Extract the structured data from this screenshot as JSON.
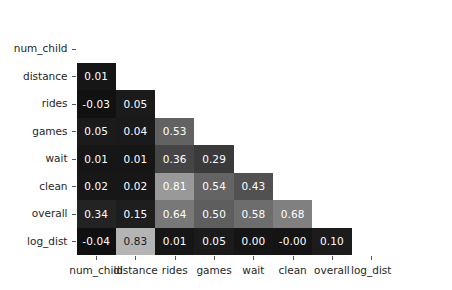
{
  "chart_data": {
    "type": "heatmap",
    "title": "",
    "xlabel": "",
    "ylabel": "",
    "grid": false,
    "legend": "none",
    "colormap": "gray",
    "annotated": true,
    "mask": "lower-triangle",
    "x_tick_labels": [
      "num_child",
      "distance",
      "rides",
      "games",
      "wait",
      "clean",
      "overall",
      "log_dist"
    ],
    "y_tick_labels": [
      "num_child",
      "distance",
      "rides",
      "games",
      "wait",
      "clean",
      "overall",
      "log_dist"
    ],
    "categories": [
      "num_child",
      "distance",
      "rides",
      "games",
      "wait",
      "clean",
      "overall",
      "log_dist"
    ],
    "zlim": [
      -0.04,
      0.83
    ],
    "rows": [
      {
        "label": "num_child",
        "cells": []
      },
      {
        "label": "distance",
        "cells": [
          {
            "col": "num_child",
            "value": "0.01",
            "v": 0.01,
            "shade": "#161616"
          }
        ]
      },
      {
        "label": "rides",
        "cells": [
          {
            "col": "num_child",
            "value": "-0.03",
            "v": -0.03,
            "shade": "#111111"
          },
          {
            "col": "distance",
            "value": "0.05",
            "v": 0.05,
            "shade": "#1b1b1b"
          }
        ]
      },
      {
        "label": "games",
        "cells": [
          {
            "col": "num_child",
            "value": "0.05",
            "v": 0.05,
            "shade": "#1b1b1b"
          },
          {
            "col": "distance",
            "value": "0.04",
            "v": 0.04,
            "shade": "#1a1a1a"
          },
          {
            "col": "rides",
            "value": "0.53",
            "v": 0.53,
            "shade": "#626262"
          }
        ]
      },
      {
        "label": "wait",
        "cells": [
          {
            "col": "num_child",
            "value": "0.01",
            "v": 0.01,
            "shade": "#161616"
          },
          {
            "col": "distance",
            "value": "0.01",
            "v": 0.01,
            "shade": "#161616"
          },
          {
            "col": "rides",
            "value": "0.36",
            "v": 0.36,
            "shade": "#454545"
          },
          {
            "col": "games",
            "value": "0.29",
            "v": 0.29,
            "shade": "#3a3a3a"
          }
        ]
      },
      {
        "label": "clean",
        "cells": [
          {
            "col": "num_child",
            "value": "0.02",
            "v": 0.02,
            "shade": "#171717"
          },
          {
            "col": "distance",
            "value": "0.02",
            "v": 0.02,
            "shade": "#171717"
          },
          {
            "col": "rides",
            "value": "0.81",
            "v": 0.81,
            "shade": "#999999"
          },
          {
            "col": "games",
            "value": "0.54",
            "v": 0.54,
            "shade": "#646464"
          },
          {
            "col": "wait",
            "value": "0.43",
            "v": 0.43,
            "shade": "#515151"
          }
        ]
      },
      {
        "label": "overall",
        "cells": [
          {
            "col": "num_child",
            "value": "0.34",
            "v": 0.34,
            "shade": "#232323"
          },
          {
            "col": "distance",
            "value": "0.15",
            "v": 0.15,
            "shade": "#1e1e1e"
          },
          {
            "col": "rides",
            "value": "0.64",
            "v": 0.64,
            "shade": "#787878"
          },
          {
            "col": "games",
            "value": "0.50",
            "v": 0.5,
            "shade": "#5e5e5e"
          },
          {
            "col": "wait",
            "value": "0.58",
            "v": 0.58,
            "shade": "#6d6d6d"
          },
          {
            "col": "clean",
            "value": "0.68",
            "v": 0.68,
            "shade": "#808080"
          }
        ]
      },
      {
        "label": "log_dist",
        "cells": [
          {
            "col": "num_child",
            "value": "-0.04",
            "v": -0.04,
            "shade": "#101010"
          },
          {
            "col": "distance",
            "value": "0.83",
            "v": 0.83,
            "shade": "#b4b4b4",
            "dark": true
          },
          {
            "col": "rides",
            "value": "0.01",
            "v": 0.01,
            "shade": "#161616"
          },
          {
            "col": "games",
            "value": "0.05",
            "v": 0.05,
            "shade": "#1b1b1b"
          },
          {
            "col": "wait",
            "value": "0.00",
            "v": 0.0,
            "shade": "#151515"
          },
          {
            "col": "clean",
            "value": "-0.00",
            "v": -0.0,
            "shade": "#141414"
          },
          {
            "col": "overall",
            "value": "0.10",
            "v": 0.1,
            "shade": "#1c1c1c"
          }
        ]
      }
    ]
  }
}
